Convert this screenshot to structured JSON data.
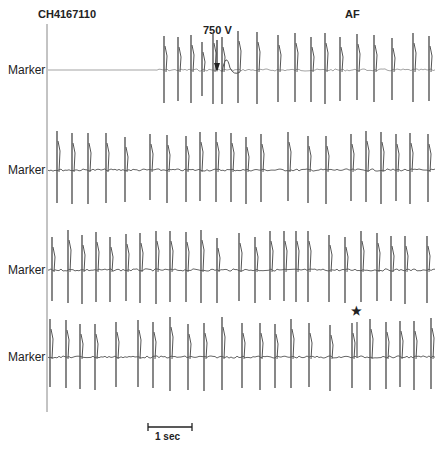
{
  "header": {
    "record_id": "CH4167110",
    "rhythm_label": "AF"
  },
  "annotations": {
    "shock_label": "750 V",
    "star_marker": "★"
  },
  "scale_bar": {
    "label": "1 sec"
  },
  "colors": {
    "trace": "#555555",
    "axis": "#888888",
    "text": "#222222"
  },
  "chart_data": {
    "type": "line",
    "title": "CH4167110",
    "subtitle": "AF",
    "xlabel": "",
    "ylabel": "",
    "rows": [
      {
        "label": "Marker",
        "baseline_y": 70,
        "flat_until_x": 155,
        "spikes_x": [
          164,
          178,
          191,
          202,
          213,
          222,
          238,
          257,
          278,
          295,
          311,
          325,
          340,
          357,
          374,
          392,
          413,
          429
        ],
        "spikes_small": [
          202
        ]
      },
      {
        "label": "Marker",
        "baseline_y": 170,
        "flat_until_x": 48,
        "spikes_x": [
          57,
          72,
          88,
          106,
          125,
          150,
          167,
          186,
          200,
          216,
          231,
          246,
          261,
          288,
          308,
          326,
          351,
          366,
          381,
          396,
          410,
          428
        ],
        "spikes_small": []
      },
      {
        "label": "Marker",
        "baseline_y": 270,
        "flat_until_x": 48,
        "spikes_x": [
          52,
          68,
          82,
          96,
          110,
          126,
          140,
          156,
          170,
          186,
          201,
          217,
          239,
          255,
          270,
          284,
          296,
          308,
          329,
          345,
          361,
          377,
          391,
          405,
          427
        ],
        "spikes_small": []
      },
      {
        "label": "Marker",
        "baseline_y": 357,
        "flat_until_x": 48,
        "spikes_x": [
          50,
          66,
          80,
          95,
          116,
          138,
          153,
          170,
          188,
          204,
          222,
          242,
          260,
          275,
          291,
          309,
          330,
          352,
          370,
          386,
          400,
          414,
          431
        ],
        "spikes_small": []
      }
    ],
    "annotations": [
      {
        "text": "750 V",
        "row": 0,
        "x": 217,
        "kind": "arrow-down"
      },
      {
        "text": "★",
        "row": 3,
        "x": 357,
        "kind": "star-above-spike"
      }
    ],
    "scale_bar": {
      "x1": 148,
      "x2": 192,
      "y": 427,
      "label": "1 sec",
      "seconds": 1
    },
    "grid": false,
    "legend": "none"
  }
}
